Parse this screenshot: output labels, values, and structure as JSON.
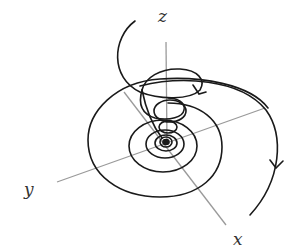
{
  "diagram": {
    "type": "3d-spiral-trajectory",
    "axes": {
      "x_label": "x",
      "y_label": "y",
      "z_label": "z"
    },
    "colors": {
      "axis": "#9a9a9a",
      "curve": "#1a1a1a",
      "label": "#333333",
      "background": "#ffffff"
    },
    "arrows": [
      {
        "name": "upper-loop-arrow",
        "direction": "clockwise"
      },
      {
        "name": "outer-spiral-arrow",
        "direction": "down"
      }
    ]
  }
}
